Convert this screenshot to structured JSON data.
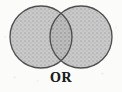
{
  "figure": {
    "kind": "venn-diagram",
    "label": "OR",
    "operation": "union",
    "caption_text": "OR",
    "background_color": "#fbfbfa"
  },
  "diagram": {
    "set_count": 2,
    "shaded_region": "union of both circles",
    "stroke_color": "#4f4f4f",
    "fill_color": "#c4c4c4",
    "overlap_fill_color": "#b4b4b4",
    "circles": [
      {
        "name": "left-set",
        "cx": 41,
        "cy": 37,
        "r": 31,
        "shaded": true
      },
      {
        "name": "right-set",
        "cx": 81,
        "cy": 37,
        "r": 31,
        "shaded": true
      }
    ]
  }
}
